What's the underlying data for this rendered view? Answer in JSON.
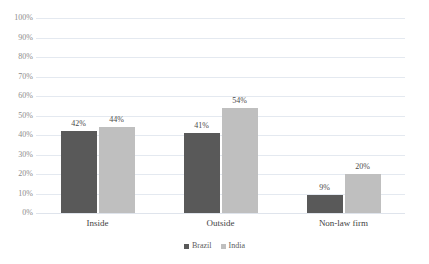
{
  "chart_data": {
    "type": "bar",
    "title": "",
    "subtitle": "",
    "xlabel": "",
    "ylabel": "",
    "ylim": [
      0,
      100
    ],
    "ytick_labels": [
      "100%",
      "90%",
      "80%",
      "70%",
      "60%",
      "50%",
      "40%",
      "30%",
      "20%",
      "10%",
      "0%"
    ],
    "ytick_values": [
      100,
      90,
      80,
      70,
      60,
      50,
      40,
      30,
      20,
      10,
      0
    ],
    "grid": true,
    "legend_position": "bottom",
    "categories": [
      "Inside",
      "Outside",
      "Non-law firm"
    ],
    "series": [
      {
        "name": "Brazil",
        "color": "#595959",
        "values": [
          42,
          41,
          9
        ],
        "data_labels": [
          "42%",
          "41%",
          "9%"
        ]
      },
      {
        "name": "India",
        "color": "#bfbfbf",
        "values": [
          44,
          54,
          20
        ],
        "data_labels": [
          "44%",
          "54%",
          "20%"
        ]
      }
    ]
  }
}
